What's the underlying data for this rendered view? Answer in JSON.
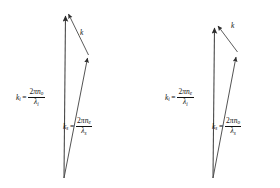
{
  "figure": {
    "type": "vector-diagram-pair",
    "background_color": "#ffffff",
    "line_color": "#2b2b2b",
    "text_color": "#111111"
  },
  "diagrams": [
    {
      "id": "left",
      "ki": {
        "symbol": "k",
        "subscript": "i",
        "equals": "=",
        "numerator_prefix": "2",
        "numerator_pi": "π",
        "numerator_n": "n",
        "numerator_n_sub": "o",
        "denominator_lambda": "λ",
        "denominator_sub": "i"
      },
      "ks": {
        "symbol": "k",
        "subscript": "s",
        "equals": "=",
        "numerator_prefix": "2",
        "numerator_pi": "π",
        "numerator_n": "n",
        "numerator_n_sub": "e",
        "denominator_lambda": "λ",
        "denominator_sub": "s"
      },
      "k": {
        "symbol": "k"
      }
    },
    {
      "id": "right",
      "ki": {
        "symbol": "k",
        "subscript": "i",
        "equals": "=",
        "numerator_prefix": "2",
        "numerator_pi": "π",
        "numerator_n": "n",
        "numerator_n_sub": "e",
        "denominator_lambda": "λ",
        "denominator_sub": "i"
      },
      "ks": {
        "symbol": "k",
        "subscript": "s",
        "equals": "=",
        "numerator_prefix": "2",
        "numerator_pi": "π",
        "numerator_n": "n",
        "numerator_n_sub": "o",
        "denominator_lambda": "λ",
        "denominator_sub": "s"
      },
      "k": {
        "symbol": "k"
      }
    }
  ]
}
